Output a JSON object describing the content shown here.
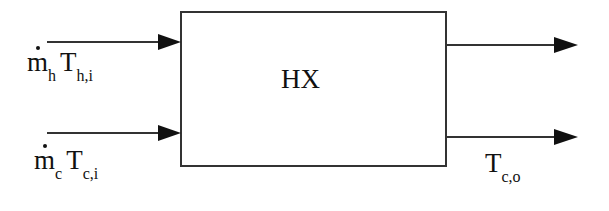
{
  "diagram": {
    "block": {
      "label": "HX"
    },
    "inputs": [
      {
        "symbol": "m",
        "symbol_sub": "h",
        "var": "T",
        "var_sub": "h,i"
      },
      {
        "symbol": "m",
        "symbol_sub": "c",
        "var": "T",
        "var_sub": "c,i"
      }
    ],
    "outputs": [
      {
        "var": "",
        "var_sub": ""
      },
      {
        "var": "T",
        "var_sub": "c,o"
      }
    ],
    "colors": {
      "stroke": "#222222",
      "background": "#ffffff"
    }
  }
}
